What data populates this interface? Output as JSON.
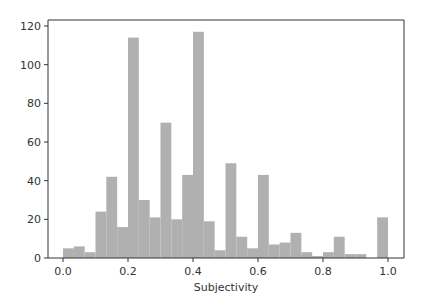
{
  "chart_data": {
    "type": "bar",
    "subtype": "histogram",
    "title": "",
    "xlabel": "Subjectivity",
    "ylabel": "",
    "xlim": [
      -0.05,
      1.05
    ],
    "ylim": [
      0,
      122
    ],
    "bin_width": 0.0333,
    "bin_edges_start": 0.0,
    "bins": 30,
    "x": [
      0.0,
      0.0333,
      0.0667,
      0.1,
      0.1333,
      0.1667,
      0.2,
      0.2333,
      0.2667,
      0.3,
      0.3333,
      0.3667,
      0.4,
      0.4333,
      0.4667,
      0.5,
      0.5333,
      0.5667,
      0.6,
      0.6333,
      0.6667,
      0.7,
      0.7333,
      0.7667,
      0.8,
      0.8333,
      0.8667,
      0.9,
      0.9333,
      0.9667
    ],
    "values": [
      5,
      6,
      3,
      24,
      42,
      16,
      114,
      30,
      21,
      70,
      20,
      43,
      117,
      19,
      4,
      49,
      11,
      5,
      43,
      7,
      8,
      13,
      3,
      1,
      3,
      11,
      2,
      2,
      0,
      21
    ],
    "xticks": [
      "0.0",
      "0.2",
      "0.4",
      "0.6",
      "0.8",
      "1.0"
    ],
    "xtick_values": [
      0.0,
      0.2,
      0.4,
      0.6,
      0.8,
      1.0
    ],
    "yticks": [
      "0",
      "20",
      "40",
      "60",
      "80",
      "100",
      "120"
    ],
    "ytick_values": [
      0,
      20,
      40,
      60,
      80,
      100,
      120
    ],
    "grid": false,
    "legend": null,
    "bar_color": "#b0b0b0"
  },
  "colors": {
    "bar": "#b0b0b0",
    "axis": "#333333",
    "background": "#ffffff"
  }
}
